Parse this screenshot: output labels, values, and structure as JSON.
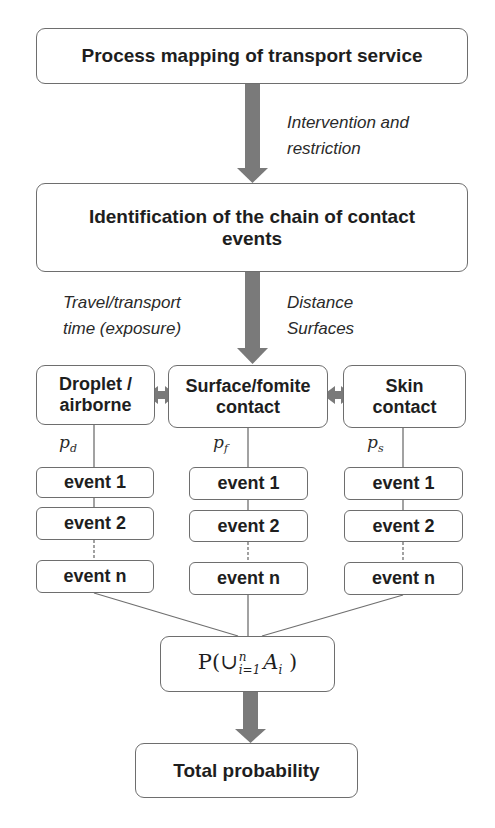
{
  "title_box": {
    "label": "Process mapping of transport service"
  },
  "arrow1_label": {
    "line1": "Intervention and",
    "line2": "restriction"
  },
  "chain_box": {
    "line1": "Identification of the chain of contact",
    "line2": "events"
  },
  "arrow2_left_label": {
    "line1": "Travel/transport",
    "line2": "time (exposure)"
  },
  "arrow2_right_label": {
    "line1": "Distance",
    "line2": "Surfaces"
  },
  "contact_types": [
    {
      "line1": "Droplet /",
      "line2": "airborne",
      "prob_base": "p",
      "prob_sub": "d"
    },
    {
      "line1": "Surface/fomite",
      "line2": "contact",
      "prob_base": "p",
      "prob_sub": "f"
    },
    {
      "line1": "Skin",
      "line2": "contact",
      "prob_base": "p",
      "prob_sub": "s"
    }
  ],
  "events": [
    "event 1",
    "event 2",
    "event n"
  ],
  "union_box": {
    "prefix": "P(",
    "union": "∪",
    "sup": "n",
    "sub": "i=1",
    "var": "A",
    "var_sub": "i",
    "suffix": " )"
  },
  "total_box": {
    "label": "Total probability"
  },
  "colors": {
    "arrow": "#7a7a7a",
    "border": "#6e6e6e",
    "line": "#707070"
  }
}
